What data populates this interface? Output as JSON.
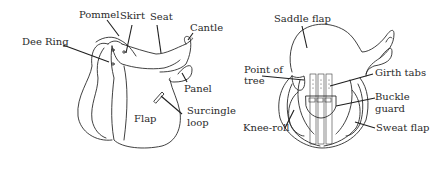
{
  "left_diagram": {
    "view": "side",
    "labels": {
      "pommel": "Pommel",
      "skirt": "Skirt",
      "seat": "Seat",
      "cantle": "Cantle",
      "dee_ring": "Dee Ring",
      "panel": "Panel",
      "surcingle_loop_1": "Surcingle",
      "surcingle_loop_2": "loop",
      "flap": "Flap"
    }
  },
  "right_diagram": {
    "view": "underside",
    "labels": {
      "saddle_flap": "Saddle flap",
      "point_of_tree_1": "Point of",
      "point_of_tree_2": "tree",
      "girth_tabs": "Girth tabs",
      "buckle_guard_1": "Buckle",
      "buckle_guard_2": "guard",
      "knee_roll": "Knee-roll",
      "sweat_flap": "Sweat flap"
    }
  },
  "colors": {
    "ink": "#2b2b2b",
    "background": "#ffffff"
  }
}
